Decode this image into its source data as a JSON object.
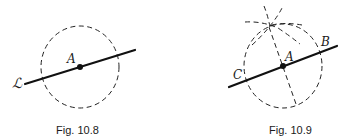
{
  "figures": [
    {
      "caption": "Fig. 10.8",
      "labels": {
        "line": "ℒ",
        "center": "A"
      },
      "elements": [
        "dashed circle centered at A",
        "solid line ℒ through A"
      ]
    },
    {
      "caption": "Fig. 10.9",
      "labels": {
        "center": "A",
        "right_intersection": "B",
        "left_intersection": "C"
      },
      "elements": [
        "dashed circle centered at A",
        "solid line through C, A, B",
        "intersecting arcs above circle",
        "dashed perpendicular through A"
      ]
    }
  ]
}
